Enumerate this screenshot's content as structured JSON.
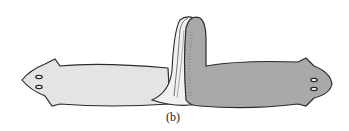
{
  "figure": {
    "caption": "(b)",
    "colors": {
      "left_worm_fill": "#e4e4e4",
      "right_worm_fill": "#a9a9a9",
      "outline": "#2a2a2a",
      "background": "#ffffff"
    },
    "elements": [
      {
        "name": "left-worm",
        "description": "light gray planarian facing left with two eyespots"
      },
      {
        "name": "right-worm",
        "description": "darker gray stippled planarian facing right with two eyespots"
      },
      {
        "name": "junction-fold",
        "description": "folded tails joined in the center"
      }
    ]
  }
}
